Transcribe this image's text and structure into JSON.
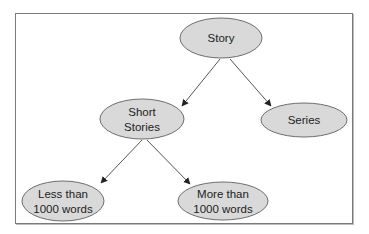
{
  "diagram": {
    "type": "tree",
    "nodes": [
      {
        "id": "story",
        "lines": [
          "Story"
        ]
      },
      {
        "id": "short_stories",
        "lines": [
          "Short",
          "Stories"
        ]
      },
      {
        "id": "series",
        "lines": [
          "Series"
        ]
      },
      {
        "id": "less_than",
        "lines": [
          "Less than",
          "1000 words"
        ]
      },
      {
        "id": "more_than",
        "lines": [
          "More than",
          "1000 words"
        ]
      }
    ],
    "edges": [
      {
        "from": "story",
        "to": "short_stories"
      },
      {
        "from": "story",
        "to": "series"
      },
      {
        "from": "short_stories",
        "to": "less_than"
      },
      {
        "from": "short_stories",
        "to": "more_than"
      }
    ],
    "colors": {
      "node_fill": "#d9d9d9",
      "node_stroke": "#6e6e6e",
      "edge": "#555555",
      "border": "#7a7a7a"
    }
  }
}
